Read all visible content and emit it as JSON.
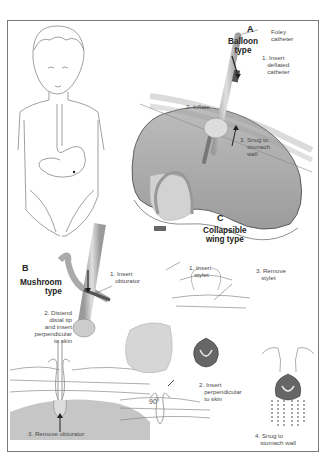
{
  "figure": {
    "panels": [
      {
        "letter": "A",
        "title": "Balloon\ntype",
        "labels": {
          "device": "Foley\ncatheter",
          "step1": "1. Insert\n   deflated\n   catheter",
          "step2": "2. Inflate",
          "step3": "3. Snug to\n    stomach\n    wall"
        }
      },
      {
        "letter": "B",
        "title": "Mushroom\ntype",
        "labels": {
          "step1": "1. Insert\n   obturator",
          "step2": "2. Distend\ndistal tip\nand insert\nperpendicular\nto skin",
          "step3": "3. Remove obturator"
        }
      },
      {
        "letter": "C",
        "title": "Collapsible\nwing type",
        "labels": {
          "step1": "1. Insert\n   stylet",
          "step2": "2. Insert\n   perpendicular\n   to skin",
          "step3": "3. Remove\n   stylet",
          "step4": "4. Snug to\n   stomach wall",
          "angle": "90°"
        }
      }
    ]
  },
  "colors": {
    "frame": "#7a7a7a",
    "stomach_fill": "#a9a9a9",
    "line": "#555555",
    "tube": "#b8b8b8",
    "hand": "#cfcfcf"
  }
}
